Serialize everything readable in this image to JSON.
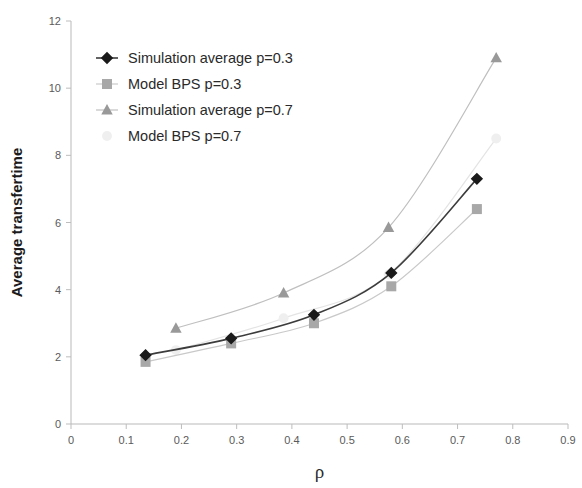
{
  "chart_data": {
    "type": "line",
    "title": "",
    "xlabel": "ρ",
    "ylabel": "Average transfertime",
    "xlim": [
      0,
      0.9
    ],
    "ylim": [
      0,
      12
    ],
    "xticks": [
      "0",
      "0.1",
      "0.2",
      "0.3",
      "0.4",
      "0.5",
      "0.6",
      "0.7",
      "0.8",
      "0.9"
    ],
    "yticks": [
      "0",
      "2",
      "4",
      "6",
      "8",
      "10",
      "12"
    ],
    "grid": false,
    "legend_position": "top-left",
    "series": [
      {
        "name": "Simulation average p=0.3",
        "marker": "diamond",
        "color": "#1a1a1a",
        "line_color": "#3c3c3c",
        "x": [
          0.135,
          0.29,
          0.44,
          0.58,
          0.735
        ],
        "values": [
          2.05,
          2.55,
          3.25,
          4.5,
          7.3
        ]
      },
      {
        "name": "Model BPS p=0.3",
        "marker": "square",
        "color": "#a8a8a8",
        "line_color": "#c9c9c9",
        "x": [
          0.135,
          0.29,
          0.44,
          0.58,
          0.735
        ],
        "values": [
          1.85,
          2.4,
          3.0,
          4.1,
          6.4
        ]
      },
      {
        "name": "Simulation average p=0.7",
        "marker": "triangle",
        "color": "#999999",
        "line_color": "#bfbfbf",
        "x": [
          0.19,
          0.385,
          0.575,
          0.77
        ],
        "values": [
          2.85,
          3.9,
          5.85,
          10.9
        ]
      },
      {
        "name": "Model BPS p=0.7",
        "marker": "circle",
        "color": "#efefef",
        "line_color": "#e4e4e4",
        "x": [
          0.19,
          0.385,
          0.575,
          0.77
        ],
        "values": [
          2.2,
          3.15,
          4.45,
          8.5
        ]
      }
    ]
  },
  "legend": {
    "items": [
      {
        "label": "Simulation average p=0.3"
      },
      {
        "label": "Model BPS p=0.3"
      },
      {
        "label": "Simulation average p=0.7"
      },
      {
        "label": "Model BPS p=0.7"
      }
    ]
  }
}
